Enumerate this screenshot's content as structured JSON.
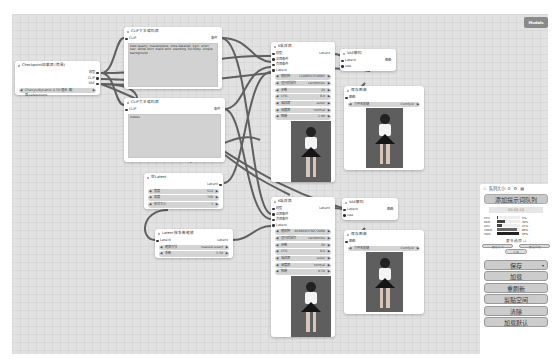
{
  "models_button": "Models",
  "nodes": {
    "checkpoint": {
      "title": "Checkpoint加载器(简易)",
      "outputs": [
        "模型",
        "CLIP",
        "VAE"
      ],
      "ckpt_value": "Chenyu/dynamic 2.5D 混合-翻版.safetensors"
    },
    "clip_pos": {
      "title": "CLIP文本编码器",
      "input": "CLIP",
      "output": "条件",
      "text": "best quality, masterpiece, ultra-detailed, 1girl, short hair, white shirt, black skirt, standing, full body, simple background"
    },
    "clip_neg": {
      "title": "CLIP文本编码器",
      "input": "CLIP",
      "output": "条件",
      "text": "lowres"
    },
    "empty_latent": {
      "title": "空Latent",
      "output": "Latent",
      "widgets": [
        {
          "label": "宽度",
          "value": "512"
        },
        {
          "label": "高度",
          "value": "768"
        },
        {
          "label": "批次大小",
          "value": "1"
        }
      ]
    },
    "upscale": {
      "title": "Latent按系数缩放",
      "input": "Latent",
      "output": "Latent",
      "widgets": [
        {
          "label": "缩放方法",
          "value": "nearest-exact"
        },
        {
          "label": "系数",
          "value": "1.50"
        }
      ]
    },
    "ksampler1": {
      "title": "K采样器",
      "inputs": [
        "模型",
        "正面条件",
        "负面条件",
        "Latent"
      ],
      "output": "Latent",
      "widgets": [
        {
          "label": "随机种",
          "value": "1108856358885"
        },
        {
          "label": "运行后操作",
          "value": "randomize"
        },
        {
          "label": "步数",
          "value": "20"
        },
        {
          "label": "CFG",
          "value": "8.0"
        },
        {
          "label": "采样器",
          "value": "euler"
        },
        {
          "label": "调度器",
          "value": "normal"
        },
        {
          "label": "降噪",
          "value": "1.00"
        }
      ]
    },
    "ksampler2": {
      "title": "K采样器",
      "inputs": [
        "模型",
        "正面条件",
        "负面条件",
        "Latent"
      ],
      "output": "Latent",
      "widgets": [
        {
          "label": "随机种",
          "value": "868869379272080"
        },
        {
          "label": "运行后操作",
          "value": "randomize"
        },
        {
          "label": "步数",
          "value": "20"
        },
        {
          "label": "CFG",
          "value": "8.0"
        },
        {
          "label": "采样器",
          "value": "euler"
        },
        {
          "label": "调度器",
          "value": "normal"
        },
        {
          "label": "降噪",
          "value": "0.50"
        }
      ]
    },
    "vae1": {
      "title": "VAE解码",
      "inputs": [
        "Latent",
        "vae"
      ],
      "output": "图像"
    },
    "vae2": {
      "title": "VAE解码",
      "inputs": [
        "Latent",
        "vae"
      ],
      "output": "图像"
    },
    "save1": {
      "title": "保存图像",
      "input": "图像",
      "prefix_label": "文件名前缀",
      "prefix_value": "ComfyUI"
    },
    "save2": {
      "title": "保存图像",
      "input": "图像",
      "prefix_label": "文件名前缀",
      "prefix_value": "ComfyUI"
    }
  },
  "panel": {
    "queue_size": "队列大小: 0",
    "add_queue": "添加提示词队列",
    "timer": "00:00:10",
    "stats": [
      {
        "label": "CPU",
        "pct": "5%",
        "val": 5
      },
      {
        "label": "RAM",
        "pct": "36%",
        "val": 36
      },
      {
        "label": "GPU",
        "pct": "21%",
        "val": 21
      },
      {
        "label": "VRAM",
        "pct": "85%",
        "val": 85
      },
      {
        "label": "HDD",
        "pct": "95%",
        "val": 95
      }
    ],
    "extra_options": "更多选项",
    "view_queue": "查看队列",
    "view_history": "查看历史",
    "share": "分享",
    "buttons": {
      "save": "保存",
      "load": "加载",
      "refresh": "重刷新",
      "clipspace": "剪贴空间",
      "clear": "清除",
      "load_default": "加载默认"
    }
  },
  "colors": {
    "canvas_bg": "#e2e2e2",
    "link": "#4a4a4a",
    "widget_bg": "#d4d4d4",
    "image_bg": "#5e5e5e"
  }
}
